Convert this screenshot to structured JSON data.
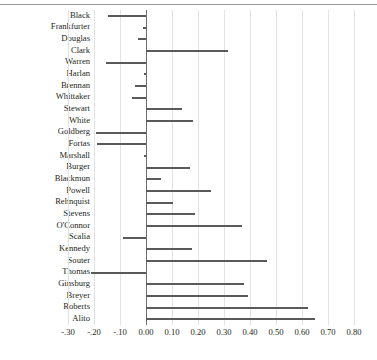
{
  "chart_data": {
    "type": "bar",
    "orientation": "horizontal",
    "title": "",
    "subtitle": "",
    "xlabel": "",
    "ylabel": "",
    "xlim": [
      -0.3,
      0.8
    ],
    "xticks": [
      -0.3,
      -0.2,
      -0.1,
      0.0,
      0.1,
      0.2,
      0.3,
      0.4,
      0.5,
      0.6,
      0.7,
      0.8
    ],
    "xtick_labels": [
      "-.30",
      "-.20",
      "-.10",
      "0.00",
      "0.10",
      "0.20",
      "0.30",
      "0.40",
      "0.50",
      "0.60",
      "0.70",
      "0.80"
    ],
    "grid": true,
    "grid_axis": "x",
    "legend": "none",
    "bar_color": "#5a5a5a",
    "zero_line_color": "#6f6f6f",
    "grid_color": "#e2e2e2",
    "categories": [
      "Black",
      "Frankfurter",
      "Douglas",
      "Clark",
      "Warren",
      "Harlan",
      "Brennan",
      "Whittaker",
      "Stewart",
      "White",
      "Goldberg",
      "Fortas",
      "Marshall",
      "Burger",
      "Blackmun",
      "Powell",
      "Rehnquist",
      "Stevens",
      "O'Connor",
      "Scalia",
      "Kennedy",
      "Souter",
      "Thomas",
      "Ginsburg",
      "Breyer",
      "Roberts",
      "Alito"
    ],
    "values": [
      -0.146,
      -0.012,
      -0.032,
      0.315,
      -0.155,
      -0.006,
      -0.042,
      -0.052,
      0.14,
      0.18,
      -0.192,
      -0.19,
      -0.008,
      0.17,
      0.058,
      0.25,
      0.104,
      0.19,
      0.37,
      -0.09,
      0.178,
      0.465,
      -0.212,
      0.378,
      0.392,
      0.623,
      0.65
    ]
  }
}
